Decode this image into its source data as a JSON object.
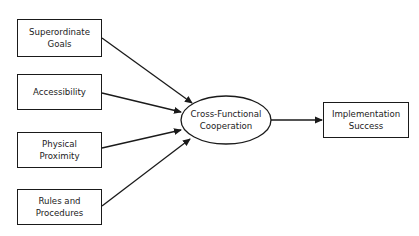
{
  "diagram": {
    "type": "flow-model",
    "colors": {
      "stroke": "#1a1a1a",
      "text": "#222222",
      "background": "#ffffff"
    },
    "inputs": [
      {
        "id": "superordinate-goals",
        "label": "Superordinate\nGoals"
      },
      {
        "id": "accessibility",
        "label": "Accessibility"
      },
      {
        "id": "physical-proximity",
        "label": "Physical\nProximity"
      },
      {
        "id": "rules-and-procedures",
        "label": "Rules and\nProcedures"
      }
    ],
    "mediator": {
      "id": "cross-functional-cooperation",
      "label": "Cross-Functional\nCooperation"
    },
    "outcome": {
      "id": "implementation-success",
      "label": "Implementation\nSuccess"
    },
    "edges": [
      {
        "from": "superordinate-goals",
        "to": "cross-functional-cooperation"
      },
      {
        "from": "accessibility",
        "to": "cross-functional-cooperation"
      },
      {
        "from": "physical-proximity",
        "to": "cross-functional-cooperation"
      },
      {
        "from": "rules-and-procedures",
        "to": "cross-functional-cooperation"
      },
      {
        "from": "cross-functional-cooperation",
        "to": "implementation-success"
      }
    ]
  }
}
